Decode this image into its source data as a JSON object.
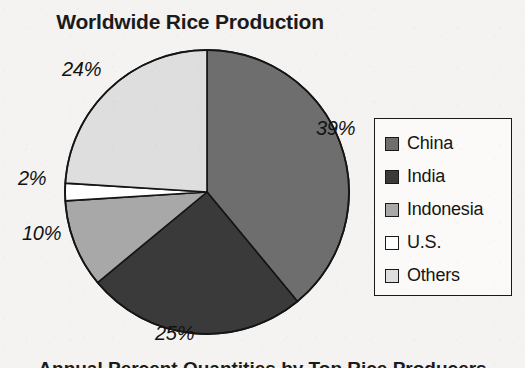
{
  "chart_data": {
    "type": "pie",
    "title": "Worldwide Rice Production",
    "caption": "Annual Percent Quantities by Top Rice Producers",
    "categories": [
      "China",
      "India",
      "Indonesia",
      "U.S.",
      "Others"
    ],
    "values": [
      39,
      25,
      10,
      2,
      24
    ],
    "value_labels": [
      "39%",
      "25%",
      "10%",
      "2%",
      "24%"
    ],
    "unit": "%",
    "start_angle_deg": 0,
    "direction": "clockwise",
    "legend_position": "right",
    "grid": false,
    "colors": [
      "#6e6e6e",
      "#3a3a3a",
      "#a8a8a8",
      "#ffffff",
      "#dedede"
    ],
    "slice_border_color": "#151515",
    "background": "#f4f3f1"
  },
  "title": {
    "text": "Worldwide Rice Production"
  },
  "caption": {
    "text": "Annual Percent Quantities by Top Rice Producers"
  },
  "labels": {
    "china": "39%",
    "india": "25%",
    "indonesia": "10%",
    "us": "2%",
    "others": "24%"
  },
  "legend": {
    "items": [
      {
        "label": "China",
        "color": "#6e6e6e"
      },
      {
        "label": "India",
        "color": "#3a3a3a"
      },
      {
        "label": "Indonesia",
        "color": "#a8a8a8"
      },
      {
        "label": "U.S.",
        "color": "#ffffff"
      },
      {
        "label": "Others",
        "color": "#dedede"
      }
    ]
  }
}
